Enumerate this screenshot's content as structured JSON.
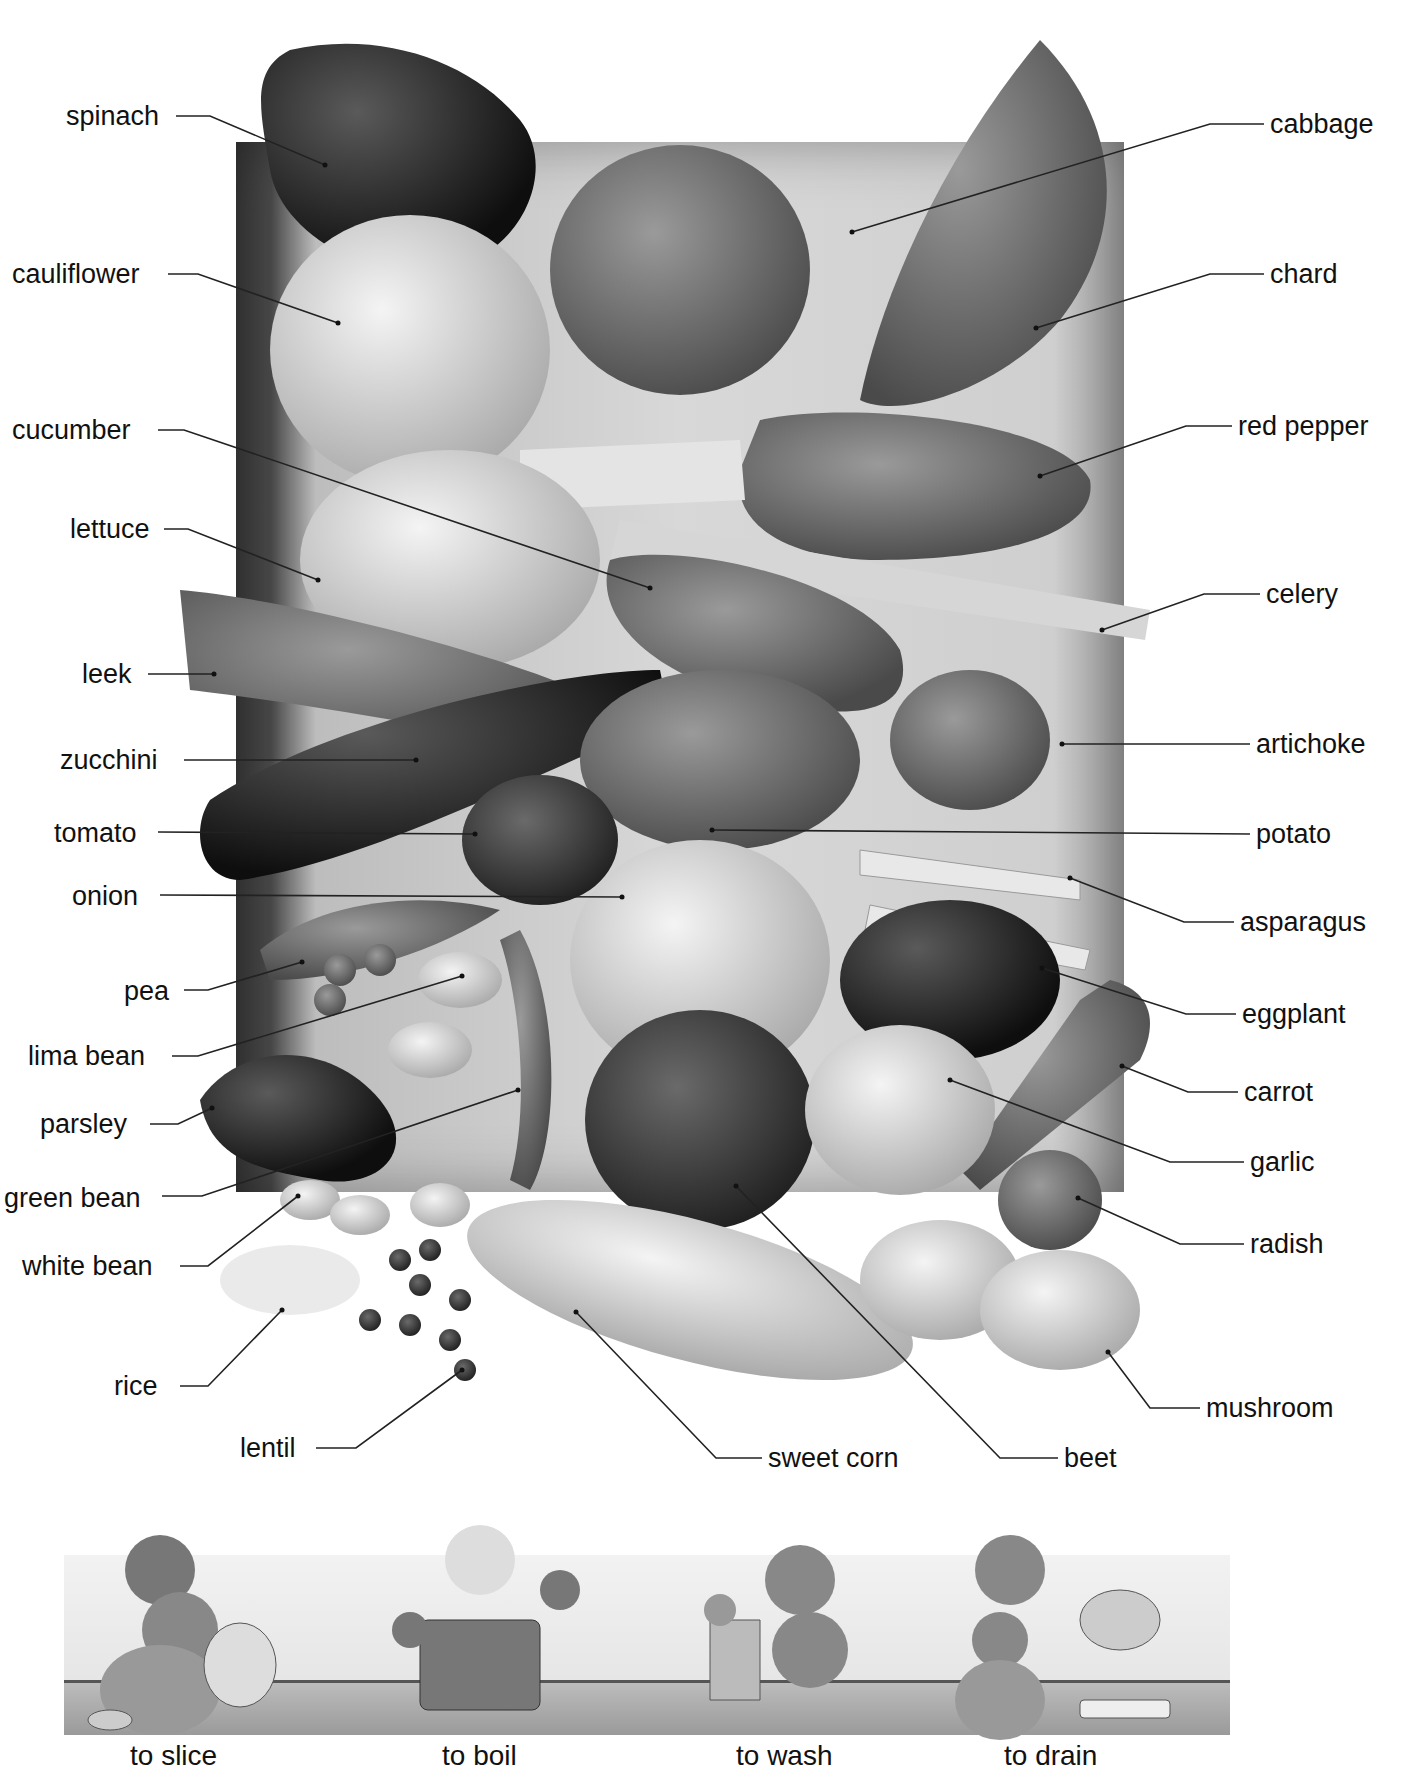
{
  "diagram": {
    "left_labels": [
      {
        "id": "spinach",
        "text": "spinach",
        "x": 66,
        "y": 100
      },
      {
        "id": "cauliflower",
        "text": "cauliflower",
        "x": 12,
        "y": 258
      },
      {
        "id": "cucumber",
        "text": "cucumber",
        "x": 12,
        "y": 414
      },
      {
        "id": "lettuce",
        "text": "lettuce",
        "x": 70,
        "y": 513
      },
      {
        "id": "leek",
        "text": "leek",
        "x": 82,
        "y": 658
      },
      {
        "id": "zucchini",
        "text": "zucchini",
        "x": 60,
        "y": 744
      },
      {
        "id": "tomato",
        "text": "tomato",
        "x": 54,
        "y": 817
      },
      {
        "id": "onion",
        "text": "onion",
        "x": 72,
        "y": 880
      },
      {
        "id": "pea",
        "text": "pea",
        "x": 124,
        "y": 975
      },
      {
        "id": "lima_bean",
        "text": "lima bean",
        "x": 28,
        "y": 1040
      },
      {
        "id": "parsley",
        "text": "parsley",
        "x": 40,
        "y": 1108
      },
      {
        "id": "green_bean",
        "text": "green bean",
        "x": 4,
        "y": 1182
      },
      {
        "id": "white_bean",
        "text": "white bean",
        "x": 22,
        "y": 1250
      },
      {
        "id": "rice",
        "text": "rice",
        "x": 114,
        "y": 1370
      },
      {
        "id": "lentil",
        "text": "lentil",
        "x": 240,
        "y": 1432
      }
    ],
    "right_labels": [
      {
        "id": "cabbage",
        "text": "cabbage",
        "x": 1270,
        "y": 108
      },
      {
        "id": "chard",
        "text": "chard",
        "x": 1270,
        "y": 258
      },
      {
        "id": "red_pepper",
        "text": "red pepper",
        "x": 1238,
        "y": 410
      },
      {
        "id": "celery",
        "text": "celery",
        "x": 1266,
        "y": 578
      },
      {
        "id": "artichoke",
        "text": "artichoke",
        "x": 1256,
        "y": 728
      },
      {
        "id": "potato",
        "text": "potato",
        "x": 1256,
        "y": 818
      },
      {
        "id": "asparagus",
        "text": "asparagus",
        "x": 1240,
        "y": 906
      },
      {
        "id": "eggplant",
        "text": "eggplant",
        "x": 1242,
        "y": 998
      },
      {
        "id": "carrot",
        "text": "carrot",
        "x": 1244,
        "y": 1076
      },
      {
        "id": "garlic",
        "text": "garlic",
        "x": 1250,
        "y": 1146
      },
      {
        "id": "radish",
        "text": "radish",
        "x": 1250,
        "y": 1228
      },
      {
        "id": "mushroom",
        "text": "mushroom",
        "x": 1206,
        "y": 1392
      }
    ],
    "bottom_labels": [
      {
        "id": "sweet_corn",
        "text": "sweet corn",
        "x": 768,
        "y": 1442
      },
      {
        "id": "beet",
        "text": "beet",
        "x": 1064,
        "y": 1442
      }
    ],
    "verbs": [
      {
        "id": "to_slice",
        "text": "to slice",
        "x": 130
      },
      {
        "id": "to_boil",
        "text": "to boil",
        "x": 442
      },
      {
        "id": "to_wash",
        "text": "to wash",
        "x": 736
      },
      {
        "id": "to_drain",
        "text": "to drain",
        "x": 1004
      }
    ]
  }
}
